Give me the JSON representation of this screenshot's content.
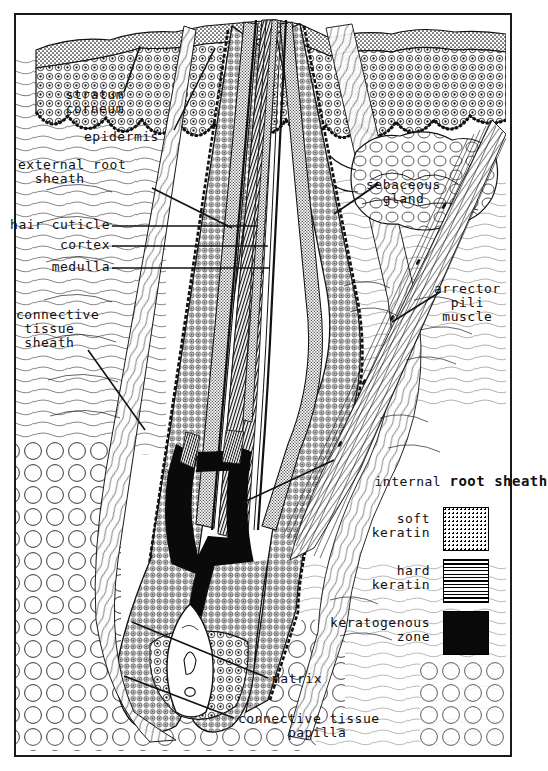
{
  "figure": {
    "style": "hand-lettered histological line drawing",
    "border_color": "#1a1a1a",
    "ink_color": "#111111"
  },
  "labels": {
    "stratum_corneum": "stratum\ncorneum",
    "epidermis": "epidermis",
    "external_root_sheath": "external root\n  sheath",
    "hair_cuticle": "hair cuticle",
    "cortex": "cortex",
    "medulla": "medulla",
    "connective_tissue_sheath": "connective\n tissue\n sheath",
    "sebaceous_gland": "sebaceous\n  gland",
    "arrector_pili_muscle": "arrector\n  pili\n muscle",
    "internal_root_sheath_a": "internal ",
    "internal_root_sheath_b": "root sheath",
    "matrix": "matrix",
    "connective_tissue_papilla": "connective tissue\n      papilla"
  },
  "legend": {
    "items": [
      {
        "label": "soft\nkeratin",
        "pattern": "stipple",
        "swatch_name": "soft-keratin-swatch"
      },
      {
        "label": "hard\nkeratin",
        "pattern": "horizontal-lines",
        "swatch_name": "hard-keratin-swatch"
      },
      {
        "label": "keratogenous\n   zone",
        "pattern": "solid-black",
        "swatch_name": "keratogenous-zone-swatch"
      }
    ]
  },
  "colors": {
    "ink": "#111111",
    "black_fill": "#0a0a0a",
    "paper": "#ffffff"
  }
}
